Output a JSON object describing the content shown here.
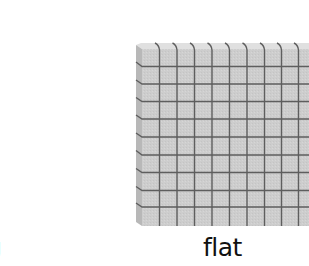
{
  "figure": {
    "labels": {
      "left_partial": "g",
      "flat": "flat"
    },
    "block": {
      "name": "flat",
      "columns": 10,
      "rows": 10,
      "colors": {
        "face": "#cfcfcf",
        "side": "#b9b9b9",
        "top_edge": "#e2e2e2",
        "grid_line": "#5f5f5f"
      }
    }
  }
}
